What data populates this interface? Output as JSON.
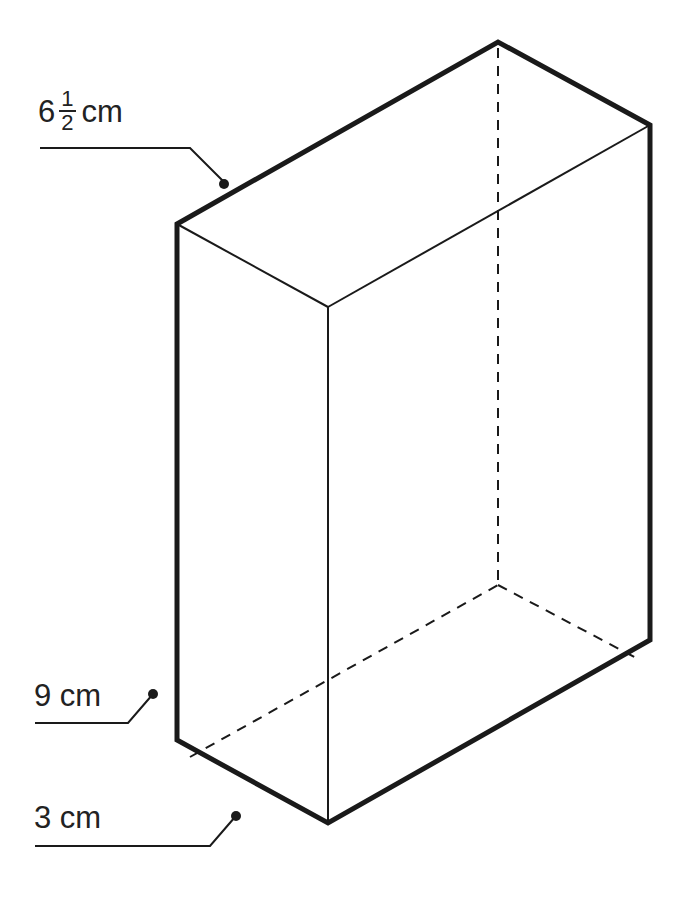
{
  "figure": {
    "type": "rectangular prism",
    "colors": {
      "stroke": "#1a1a1a",
      "background": "#ffffff"
    },
    "labels": {
      "length": {
        "whole": "6",
        "numerator": "1",
        "denominator": "2",
        "unit": "cm"
      },
      "height": {
        "text": "9 cm"
      },
      "width": {
        "text": "3 cm"
      }
    }
  }
}
